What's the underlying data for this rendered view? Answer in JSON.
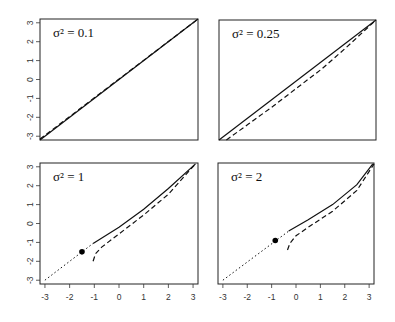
{
  "chart_data": [
    {
      "type": "line",
      "title": "σ² = 0.1",
      "xlabel": "",
      "ylabel": "",
      "xlim": [
        -3.2,
        3.2
      ],
      "ylim": [
        -3.2,
        3.2
      ],
      "xticks": [],
      "yticks": [
        "-3",
        "-2",
        "-1",
        "0",
        "1",
        "2",
        "3"
      ],
      "series": [
        {
          "name": "solid",
          "style": "solid",
          "x": [
            -3.2,
            3.2
          ],
          "y": [
            -3.2,
            3.2
          ]
        },
        {
          "name": "dashed",
          "style": "dashed",
          "x": [
            -3.2,
            3.2
          ],
          "y": [
            -3.15,
            3.2
          ]
        }
      ],
      "point": null
    },
    {
      "type": "line",
      "title": "σ² = 0.25",
      "xlabel": "",
      "ylabel": "",
      "xlim": [
        -3.2,
        3.2
      ],
      "ylim": [
        -3.2,
        3.2
      ],
      "xticks": [],
      "yticks": [],
      "series": [
        {
          "name": "solid",
          "style": "solid",
          "x": [
            -3.2,
            3.2
          ],
          "y": [
            -3.2,
            3.2
          ]
        },
        {
          "name": "dashed",
          "style": "dashed",
          "x": [
            -2.9,
            -2,
            -1,
            0,
            1,
            2,
            3.2
          ],
          "y": [
            -3.2,
            -2.35,
            -1.4,
            -0.4,
            0.6,
            1.75,
            3.2
          ]
        }
      ],
      "point": null
    },
    {
      "type": "line",
      "title": "σ² = 1",
      "xlabel": "",
      "ylabel": "",
      "xlim": [
        -3.2,
        3.2
      ],
      "ylim": [
        -3.2,
        3.2
      ],
      "xticks": [
        "-3",
        "-2",
        "-1",
        "0",
        "1",
        "2",
        "3"
      ],
      "yticks": [
        "-3",
        "-2",
        "-1",
        "0",
        "1",
        "2",
        "3"
      ],
      "series": [
        {
          "name": "dotted",
          "style": "dotted",
          "x": [
            -3.0,
            -1.05
          ],
          "y": [
            -3.0,
            -1.05
          ]
        },
        {
          "name": "solid",
          "style": "solid",
          "x": [
            -1.05,
            0,
            1,
            2,
            3.1
          ],
          "y": [
            -1.05,
            -0.2,
            0.75,
            1.85,
            3.15
          ]
        },
        {
          "name": "dashed",
          "style": "dashed",
          "x": [
            -1.05,
            -0.95,
            -0.7,
            0,
            1,
            2,
            3.1
          ],
          "y": [
            -2.0,
            -1.6,
            -1.25,
            -0.55,
            0.45,
            1.55,
            3.15
          ]
        }
      ],
      "point": {
        "x": -1.5,
        "y": -1.5
      }
    },
    {
      "type": "line",
      "title": "σ² = 2",
      "xlabel": "",
      "ylabel": "",
      "xlim": [
        -3.2,
        3.2
      ],
      "ylim": [
        -3.2,
        3.2
      ],
      "xticks": [
        "-3",
        "-2",
        "-1",
        "0",
        "1",
        "2",
        "3"
      ],
      "yticks": [],
      "series": [
        {
          "name": "dotted",
          "style": "dotted",
          "x": [
            -3.0,
            -0.3
          ],
          "y": [
            -3.0,
            -0.4
          ]
        },
        {
          "name": "solid",
          "style": "solid",
          "x": [
            -0.3,
            0.5,
            1.5,
            2.5,
            3.15
          ],
          "y": [
            -0.4,
            0.2,
            1.0,
            2.05,
            3.15
          ]
        },
        {
          "name": "dashed",
          "style": "dashed",
          "x": [
            -0.35,
            -0.25,
            0,
            0.5,
            1.5,
            2.5,
            3.2
          ],
          "y": [
            -1.4,
            -1.05,
            -0.65,
            -0.2,
            0.65,
            1.75,
            3.15
          ]
        }
      ],
      "point": {
        "x": -0.85,
        "y": -0.9
      }
    }
  ],
  "panels": [
    {
      "label": "σ² = 0.1"
    },
    {
      "label": "σ² = 0.25"
    },
    {
      "label": "σ² = 1"
    },
    {
      "label": "σ² = 2"
    }
  ]
}
